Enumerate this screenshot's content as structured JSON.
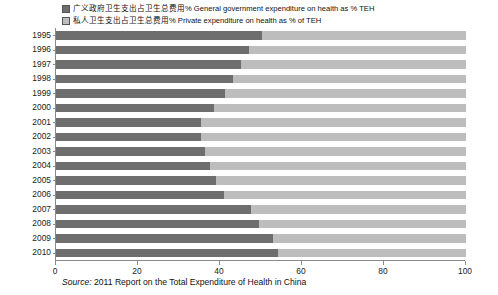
{
  "legend": {
    "items": [
      {
        "icon": "square-swatch-icon",
        "key": "gov",
        "label": "广义政府卫生支出占卫生总费用% General government expenditure on health as % TEH"
      },
      {
        "icon": "square-swatch-icon",
        "key": "priv",
        "label": "私人卫生支出占卫生总费用% Private expenditure on health as % of TEH"
      }
    ]
  },
  "source": {
    "prefix": "Source:",
    "text": "2011 Report on the Total Expenditure of Health in China"
  },
  "colors": {
    "government": "#6e6e6e",
    "private": "#bdbdbd",
    "axis": "#8a8a8a",
    "background": "#ffffff"
  },
  "chart_data": {
    "type": "bar",
    "orientation": "horizontal",
    "stacked": true,
    "normalized": true,
    "title": "",
    "subtitle": "",
    "xlabel": "",
    "ylabel": "",
    "xlim": [
      0,
      100
    ],
    "xticks": [
      0,
      20,
      40,
      60,
      80,
      100
    ],
    "xtick_labels": [
      "0",
      "20",
      "40",
      "60",
      "80",
      "100"
    ],
    "grid": false,
    "legend_position": "top",
    "categories": [
      "1995",
      "1996",
      "1997",
      "1998",
      "1999",
      "2000",
      "2001",
      "2002",
      "2003",
      "2004",
      "2005",
      "2006",
      "2007",
      "2008",
      "2009",
      "2010"
    ],
    "series": [
      {
        "name": "General government expenditure on health as % TEH",
        "key": "gov",
        "color": "#6e6e6e",
        "values": [
          50.2,
          47.1,
          45.2,
          43.2,
          41.2,
          38.5,
          35.4,
          35.4,
          36.4,
          37.6,
          39.0,
          41.0,
          47.6,
          49.5,
          52.9,
          54.2
        ]
      },
      {
        "name": "Private expenditure on health as % of TEH",
        "key": "priv",
        "color": "#bdbdbd",
        "values": [
          49.8,
          52.9,
          54.8,
          56.8,
          58.8,
          61.5,
          64.6,
          64.6,
          63.6,
          62.4,
          61.0,
          59.0,
          52.4,
          50.5,
          47.1,
          45.8
        ]
      }
    ]
  }
}
